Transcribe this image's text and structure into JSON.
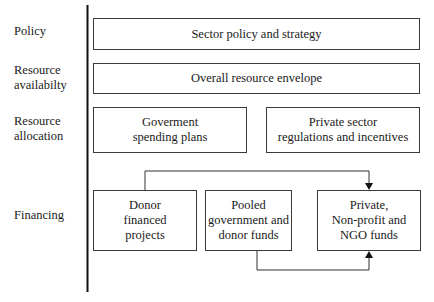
{
  "rows": {
    "policy": "Policy",
    "availability": "Resource\navailabilty",
    "allocation": "Resource\nallocation",
    "financing": "Financing"
  },
  "boxes": {
    "sector_policy": "Sector policy and strategy",
    "resource_envelope": "Overall resource envelope",
    "gov_spending": "Goverment\nspending plans",
    "private_regulations": "Private sector\nregulations and incentives",
    "donor_projects": "Donor\nfinanced\nprojects",
    "pooled_funds": "Pooled\ngovernment and\ndonor funds",
    "private_ngo": "Private,\nNon-profit and\nNGO funds"
  },
  "connectors": [
    {
      "from": "donor_projects",
      "to": "private_ngo",
      "route": "top"
    },
    {
      "from": "pooled_funds",
      "to": "private_ngo",
      "route": "bottom"
    }
  ]
}
